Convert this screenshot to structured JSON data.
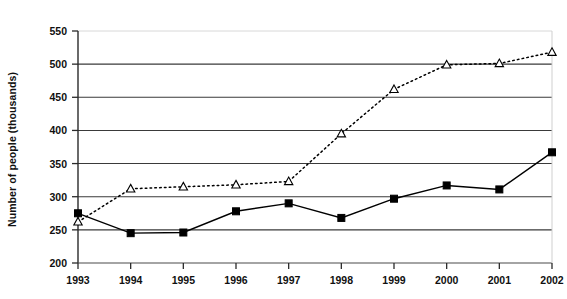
{
  "chart_data": {
    "type": "line",
    "title": "",
    "xlabel": "",
    "ylabel": "Number of people (thousands)",
    "categories": [
      "1993",
      "1994",
      "1995",
      "1996",
      "1997",
      "1998",
      "1999",
      "2000",
      "2001",
      "2002"
    ],
    "x": [
      1993,
      1994,
      1995,
      1996,
      1997,
      1998,
      1999,
      2000,
      2001,
      2002
    ],
    "ylim": [
      200,
      550
    ],
    "yticks": [
      200,
      250,
      300,
      350,
      400,
      450,
      500,
      550
    ],
    "ytick_labels": [
      "200",
      "250",
      "300",
      "350",
      "400",
      "450",
      "500",
      "550"
    ],
    "grid": true,
    "grid_axis": "y",
    "legend": "none",
    "series": [
      {
        "name": "series-squares",
        "marker": "filled-square",
        "line_style": "solid",
        "color": "#000000",
        "values": [
          275,
          245,
          246,
          278,
          290,
          268,
          297,
          317,
          311,
          367
        ]
      },
      {
        "name": "series-triangles",
        "marker": "open-triangle",
        "line_style": "dotted",
        "color": "#000000",
        "values": [
          262,
          312,
          315,
          318,
          323,
          395,
          462,
          499,
          501,
          518
        ]
      }
    ]
  },
  "axes": {
    "y_title": "Number of people (thousands)"
  }
}
